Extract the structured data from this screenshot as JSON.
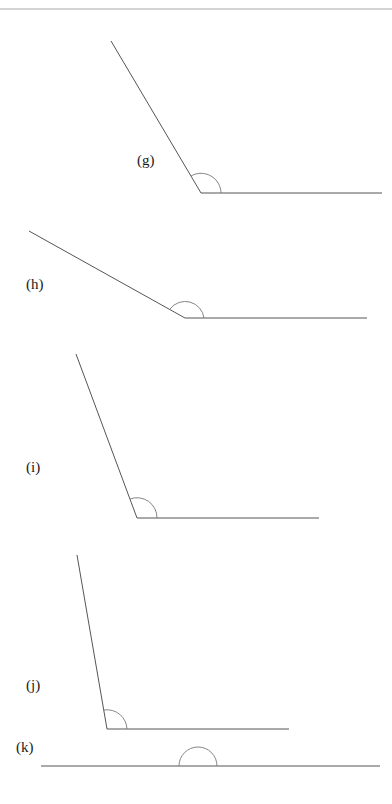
{
  "figure": {
    "type": "angle-diagram",
    "colors": {
      "line": "#555555",
      "arc": "#777777",
      "label": "#1a1a1a",
      "background": "#ffffff"
    },
    "angles": [
      {
        "label": "(g)",
        "kind": "obtuse",
        "vertex": [
          201,
          193
        ],
        "ray1_end": [
          111,
          41
        ],
        "ray2_end": [
          382,
          193
        ]
      },
      {
        "label": "(h)",
        "kind": "obtuse",
        "vertex": [
          185,
          318
        ],
        "ray1_end": [
          29,
          231
        ],
        "ray2_end": [
          367,
          318
        ]
      },
      {
        "label": "(i)",
        "kind": "obtuse",
        "vertex": [
          137,
          518
        ],
        "ray1_end": [
          76,
          354
        ],
        "ray2_end": [
          319,
          518
        ]
      },
      {
        "label": "(j)",
        "kind": "obtuse",
        "vertex": [
          107,
          729
        ],
        "ray1_end": [
          77,
          555
        ],
        "ray2_end": [
          289,
          729
        ]
      },
      {
        "label": "(k)",
        "kind": "straight",
        "vertex": [
          198,
          766
        ],
        "ray1_end": [
          41,
          766
        ],
        "ray2_end": [
          380,
          766
        ]
      }
    ]
  }
}
